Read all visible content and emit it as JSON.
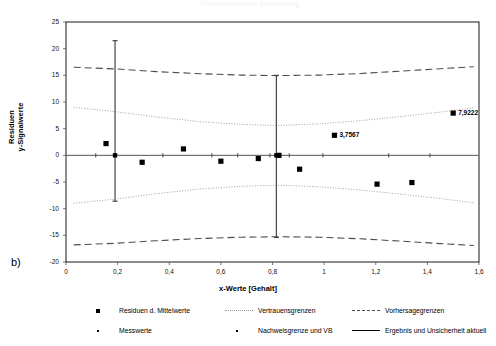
{
  "figure": {
    "panel_tag": "b)",
    "faint_title": "Residuenanalyse Kalibrierung"
  },
  "chart_data": {
    "type": "scatter",
    "title": "",
    "xlabel": "x-Werte [Gehalt]",
    "ylabel": "Residuen y-Signalwerte",
    "ylabel_lines": [
      "Residuen",
      "y-Signalwerte"
    ],
    "xlim": [
      0,
      1.6
    ],
    "ylim": [
      -20,
      25
    ],
    "xticks": [
      0,
      0.2,
      0.4,
      0.6,
      0.8,
      1,
      1.2,
      1.4,
      1.6
    ],
    "xticklabels": [
      "0",
      "0,2",
      "0,4",
      "0,6",
      "0,8",
      "1",
      "1,2",
      "1,4",
      "1,6"
    ],
    "yticks": [
      -20,
      -15,
      -10,
      -5,
      0,
      5,
      10,
      15,
      20,
      25
    ],
    "yticklabels": [
      "-20",
      "-15",
      "-10",
      "-5",
      "0",
      "5",
      "10",
      "15",
      "20",
      "25"
    ],
    "grid": false,
    "legend_position": "below",
    "series": [
      {
        "name": "Residuen d. Mittelwerte",
        "marker": "square",
        "points": [
          {
            "x": 0.155,
            "y": 2.2
          },
          {
            "x": 0.295,
            "y": -1.3
          },
          {
            "x": 0.455,
            "y": 1.2
          },
          {
            "x": 0.6,
            "y": -1.1
          },
          {
            "x": 0.745,
            "y": -0.6
          },
          {
            "x": 0.825,
            "y": 0.0
          },
          {
            "x": 1.04,
            "y": 3.7567,
            "label": "3,7567"
          },
          {
            "x": 0.905,
            "y": -2.6
          },
          {
            "x": 1.205,
            "y": -5.4
          },
          {
            "x": 1.34,
            "y": -5.1
          },
          {
            "x": 1.5,
            "y": 7.9222,
            "label": "7,9222"
          }
        ]
      },
      {
        "name": "Messwerte",
        "marker": "dot",
        "points": [
          {
            "x": 0.115,
            "y": 0.0
          },
          {
            "x": 0.19,
            "y": 0.0
          },
          {
            "x": 0.375,
            "y": 0.0
          },
          {
            "x": 0.565,
            "y": 0.0
          },
          {
            "x": 0.665,
            "y": 0.0
          },
          {
            "x": 0.79,
            "y": 0.0
          },
          {
            "x": 0.865,
            "y": 0.0
          },
          {
            "x": 0.995,
            "y": 0.0
          },
          {
            "x": 1.25,
            "y": 0.0
          },
          {
            "x": 1.41,
            "y": 0.0
          }
        ]
      },
      {
        "name": "Vertrauensgrenzen",
        "style": "dotted",
        "upper": [
          {
            "x": 0.03,
            "y": 9.0
          },
          {
            "x": 0.19,
            "y": 8.2
          },
          {
            "x": 0.35,
            "y": 7.2
          },
          {
            "x": 0.52,
            "y": 6.3
          },
          {
            "x": 0.68,
            "y": 5.8
          },
          {
            "x": 0.82,
            "y": 5.6
          },
          {
            "x": 0.98,
            "y": 5.9
          },
          {
            "x": 1.14,
            "y": 6.5
          },
          {
            "x": 1.3,
            "y": 7.3
          },
          {
            "x": 1.45,
            "y": 8.1
          },
          {
            "x": 1.58,
            "y": 8.9
          }
        ],
        "lower": [
          {
            "x": 0.03,
            "y": -9.0
          },
          {
            "x": 0.19,
            "y": -8.2
          },
          {
            "x": 0.35,
            "y": -7.2
          },
          {
            "x": 0.52,
            "y": -6.3
          },
          {
            "x": 0.68,
            "y": -5.8
          },
          {
            "x": 0.82,
            "y": -5.6
          },
          {
            "x": 0.98,
            "y": -5.9
          },
          {
            "x": 1.14,
            "y": -6.5
          },
          {
            "x": 1.3,
            "y": -7.3
          },
          {
            "x": 1.45,
            "y": -8.1
          },
          {
            "x": 1.58,
            "y": -8.9
          }
        ]
      },
      {
        "name": "Vorhersagegrenzen",
        "style": "dashed",
        "upper": [
          {
            "x": 0.03,
            "y": 16.5
          },
          {
            "x": 0.19,
            "y": 16.2
          },
          {
            "x": 0.35,
            "y": 15.7
          },
          {
            "x": 0.52,
            "y": 15.3
          },
          {
            "x": 0.68,
            "y": 15.05
          },
          {
            "x": 0.82,
            "y": 14.95
          },
          {
            "x": 0.98,
            "y": 15.05
          },
          {
            "x": 1.14,
            "y": 15.35
          },
          {
            "x": 1.3,
            "y": 15.8
          },
          {
            "x": 1.45,
            "y": 16.25
          },
          {
            "x": 1.58,
            "y": 16.6
          }
        ],
        "lower": [
          {
            "x": 0.03,
            "y": -16.8
          },
          {
            "x": 0.19,
            "y": -16.5
          },
          {
            "x": 0.35,
            "y": -16.0
          },
          {
            "x": 0.52,
            "y": -15.6
          },
          {
            "x": 0.68,
            "y": -15.35
          },
          {
            "x": 0.82,
            "y": -15.25
          },
          {
            "x": 0.98,
            "y": -15.35
          },
          {
            "x": 1.14,
            "y": -15.65
          },
          {
            "x": 1.3,
            "y": -16.1
          },
          {
            "x": 1.45,
            "y": -16.55
          },
          {
            "x": 1.58,
            "y": -16.9
          }
        ]
      },
      {
        "name": "Nachweisgrenze und VB",
        "marker": "dot",
        "style": "solid",
        "bars": [
          {
            "x": 0.19,
            "y_low": -8.6,
            "y_high": 21.5,
            "center": 0.0
          },
          {
            "x": 0.815,
            "y_low": -15.4,
            "y_high": 15.0,
            "center": 0.0
          }
        ]
      },
      {
        "name": "Ergebnis und Unsicherheit aktuell",
        "style": "solid"
      }
    ]
  },
  "legend": {
    "items": [
      {
        "label": "Residuen d. Mittelwerte",
        "key": "square-marker"
      },
      {
        "label": "Vertrauensgrenzen",
        "key": "dotted-line"
      },
      {
        "label": "Vorhersagegrenzen",
        "key": "dashed-line"
      },
      {
        "label": "Messwerte",
        "key": "dot-marker"
      },
      {
        "label": "Nachweisgrenze und VB",
        "key": "dot-marker"
      },
      {
        "label": "Ergebnis und Unsicherheit aktuell",
        "key": "solid-line"
      }
    ]
  },
  "colors": {
    "axis": "#000000",
    "marker": "#000000",
    "confidence": "#9a9a9a",
    "prediction": "#4d4d4d",
    "background": "#ffffff"
  }
}
